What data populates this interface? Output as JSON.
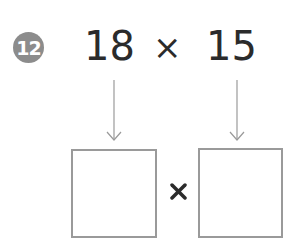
{
  "problem": {
    "number": "12",
    "left_operand": "18",
    "operator": "×",
    "right_operand": "15"
  },
  "answer": {
    "left_box_value": "",
    "operator": "×",
    "right_box_value": ""
  },
  "colors": {
    "badge": "#8c8c8c",
    "text": "#2b2b2b",
    "box_border": "#9a9a9a",
    "arrow": "#9a9a9a"
  }
}
